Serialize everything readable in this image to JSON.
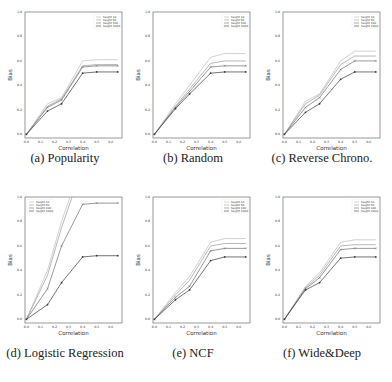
{
  "figure": {
    "captions": [
      "(a) Popularity",
      "(b) Random",
      "(c) Reverse Chrono.",
      "(d) Logistic Regression",
      "(e) NCF",
      "(f) Wide&Deep"
    ]
  },
  "chart_data": [
    {
      "type": "line",
      "title": "(a) Popularity",
      "xlabel": "Correlation",
      "ylabel": "Bias",
      "x": [
        0.0,
        0.15,
        0.25,
        0.4,
        0.5,
        0.65
      ],
      "xticks": [
        "0.0",
        "0.1",
        "0.2",
        "0.3",
        "0.4",
        "0.5",
        "0.6"
      ],
      "yticks": [
        "0.0",
        "0.2",
        "0.4",
        "0.6",
        "0.8",
        "1.0"
      ],
      "xlim": [
        0.0,
        0.65
      ],
      "ylim": [
        0.0,
        1.0
      ],
      "grid": false,
      "legend_position": "upper right",
      "series": [
        {
          "name": "height 10",
          "values": [
            0.0,
            0.25,
            0.3,
            0.6,
            0.61,
            0.61
          ]
        },
        {
          "name": "height 50",
          "values": [
            0.0,
            0.23,
            0.29,
            0.56,
            0.57,
            0.57
          ]
        },
        {
          "name": "height 100",
          "values": [
            0.0,
            0.22,
            0.28,
            0.55,
            0.56,
            0.56
          ]
        },
        {
          "name": "height 1000",
          "values": [
            0.0,
            0.19,
            0.25,
            0.5,
            0.51,
            0.51
          ]
        }
      ]
    },
    {
      "type": "line",
      "title": "(b) Random",
      "xlabel": "Correlation",
      "ylabel": "Bias",
      "x": [
        0.0,
        0.15,
        0.25,
        0.4,
        0.5,
        0.65
      ],
      "xticks": [
        "0.0",
        "0.1",
        "0.2",
        "0.3",
        "0.4",
        "0.5",
        "0.6"
      ],
      "yticks": [
        "0.0",
        "0.2",
        "0.4",
        "0.6",
        "0.8",
        "1.0"
      ],
      "xlim": [
        0.0,
        0.65
      ],
      "ylim": [
        0.0,
        1.0
      ],
      "grid": false,
      "legend_position": "upper right",
      "series": [
        {
          "name": "height 10",
          "values": [
            0.0,
            0.25,
            0.4,
            0.63,
            0.66,
            0.66
          ]
        },
        {
          "name": "height 50",
          "values": [
            0.0,
            0.23,
            0.37,
            0.58,
            0.6,
            0.6
          ]
        },
        {
          "name": "height 100",
          "values": [
            0.0,
            0.22,
            0.35,
            0.55,
            0.56,
            0.56
          ]
        },
        {
          "name": "height 1000",
          "values": [
            0.0,
            0.21,
            0.33,
            0.5,
            0.51,
            0.51
          ]
        }
      ]
    },
    {
      "type": "line",
      "title": "(c) Reverse Chrono.",
      "xlabel": "Correlation",
      "ylabel": "Bias",
      "x": [
        0.0,
        0.15,
        0.25,
        0.4,
        0.5,
        0.65
      ],
      "xticks": [
        "0.0",
        "0.1",
        "0.2",
        "0.3",
        "0.4",
        "0.5",
        "0.6"
      ],
      "yticks": [
        "0.0",
        "0.2",
        "0.4",
        "0.6",
        "0.8",
        "1.0"
      ],
      "xlim": [
        0.0,
        0.65
      ],
      "ylim": [
        0.0,
        1.0
      ],
      "grid": false,
      "legend_position": "upper right",
      "series": [
        {
          "name": "height 10",
          "values": [
            0.0,
            0.27,
            0.33,
            0.6,
            0.68,
            0.68
          ]
        },
        {
          "name": "height 50",
          "values": [
            0.0,
            0.25,
            0.32,
            0.57,
            0.64,
            0.64
          ]
        },
        {
          "name": "height 100",
          "values": [
            0.0,
            0.22,
            0.3,
            0.53,
            0.6,
            0.6
          ]
        },
        {
          "name": "height 1000",
          "values": [
            0.0,
            0.18,
            0.25,
            0.45,
            0.51,
            0.51
          ]
        }
      ]
    },
    {
      "type": "line",
      "title": "(d) Logistic Regression",
      "xlabel": "Correlation",
      "ylabel": "Bias",
      "x": [
        0.0,
        0.15,
        0.25,
        0.4,
        0.5,
        0.65
      ],
      "xticks": [
        "0.0",
        "0.1",
        "0.2",
        "0.3",
        "0.4",
        "0.5",
        "0.6"
      ],
      "yticks": [
        "0.0",
        "0.2",
        "0.4",
        "0.6",
        "0.8",
        "1.0"
      ],
      "xlim": [
        0.0,
        0.65
      ],
      "ylim": [
        0.0,
        1.0
      ],
      "grid": false,
      "legend_position": "upper left",
      "series": [
        {
          "name": "height 10",
          "values": [
            0.0,
            0.4,
            0.8,
            1.3,
            1.5,
            1.6
          ]
        },
        {
          "name": "height 50",
          "values": [
            0.0,
            0.36,
            0.75,
            1.25,
            1.4,
            1.5
          ]
        },
        {
          "name": "height 100",
          "values": [
            0.0,
            0.25,
            0.6,
            0.94,
            0.95,
            0.95
          ]
        },
        {
          "name": "height 1000",
          "values": [
            0.0,
            0.12,
            0.3,
            0.51,
            0.52,
            0.52
          ]
        }
      ]
    },
    {
      "type": "line",
      "title": "(e) NCF",
      "xlabel": "Correlation",
      "ylabel": "Bias",
      "x": [
        0.0,
        0.15,
        0.25,
        0.4,
        0.5,
        0.65
      ],
      "xticks": [
        "0.0",
        "0.1",
        "0.2",
        "0.3",
        "0.4",
        "0.5",
        "0.6"
      ],
      "yticks": [
        "0.0",
        "0.2",
        "0.4",
        "0.6",
        "0.8",
        "1.0"
      ],
      "xlim": [
        0.0,
        0.65
      ],
      "ylim": [
        0.0,
        1.0
      ],
      "grid": false,
      "legend_position": "upper right",
      "series": [
        {
          "name": "height 10",
          "values": [
            0.0,
            0.22,
            0.35,
            0.63,
            0.66,
            0.66
          ]
        },
        {
          "name": "height 50",
          "values": [
            0.0,
            0.2,
            0.32,
            0.6,
            0.62,
            0.62
          ]
        },
        {
          "name": "height 100",
          "values": [
            0.0,
            0.18,
            0.27,
            0.56,
            0.58,
            0.58
          ]
        },
        {
          "name": "height 1000",
          "values": [
            0.0,
            0.16,
            0.24,
            0.48,
            0.51,
            0.51
          ]
        }
      ]
    },
    {
      "type": "line",
      "title": "(f) Wide&Deep",
      "xlabel": "Correlation",
      "ylabel": "Bias",
      "x": [
        0.0,
        0.15,
        0.25,
        0.4,
        0.5,
        0.65
      ],
      "xticks": [
        "0.0",
        "0.1",
        "0.2",
        "0.3",
        "0.4",
        "0.5",
        "0.6"
      ],
      "yticks": [
        "0.0",
        "0.2",
        "0.4",
        "0.6",
        "0.8",
        "1.0"
      ],
      "xlim": [
        0.0,
        0.65
      ],
      "ylim": [
        0.0,
        1.0
      ],
      "grid": false,
      "legend_position": "upper right",
      "series": [
        {
          "name": "height 10",
          "values": [
            0.0,
            0.27,
            0.38,
            0.63,
            0.65,
            0.65
          ]
        },
        {
          "name": "height 50",
          "values": [
            0.0,
            0.26,
            0.36,
            0.6,
            0.61,
            0.61
          ]
        },
        {
          "name": "height 100",
          "values": [
            0.0,
            0.25,
            0.34,
            0.57,
            0.58,
            0.58
          ]
        },
        {
          "name": "height 1000",
          "values": [
            0.0,
            0.24,
            0.3,
            0.5,
            0.51,
            0.51
          ]
        }
      ]
    }
  ],
  "style": {
    "series_colors": [
      "#bdbdbd",
      "#9a9a9a",
      "#6e6e6e",
      "#3a3a3a"
    ],
    "markers": [
      "none",
      "none",
      "x",
      "dot"
    ]
  }
}
